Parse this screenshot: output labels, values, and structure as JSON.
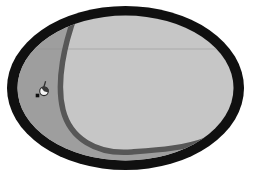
{
  "scene": {
    "kind": "grayscale-oval-illustration",
    "background": "#ffffff",
    "colors": {
      "ring": "#101010",
      "interior": "#c6c6c6",
      "shade": "#9e9e9e",
      "curve": "#575757",
      "guide_line": "#8f8f8f",
      "sprite_body": "#f5f5f5",
      "sprite_outline": "#2b2b2b",
      "sprite_cap": "#3a3a3a",
      "sprite_mast": "#333333",
      "sprite_dot": "#0e0e0e"
    },
    "shapes": {
      "outer_ellipse": {
        "cx": 125.5,
        "cy": 88,
        "rx": 118.5,
        "ry": 82
      },
      "inner_ellipse": {
        "cx": 125.5,
        "cy": 88,
        "rx": 108,
        "ry": 72.5
      },
      "guide_line": {
        "y": 49,
        "x1": 12,
        "x2": 242
      },
      "sprite": {
        "cx": 44,
        "cy": 91.3,
        "r": 4.3,
        "dot_x": 35.7,
        "dot_y": 93.7,
        "dot_size": 3.6
      }
    }
  }
}
